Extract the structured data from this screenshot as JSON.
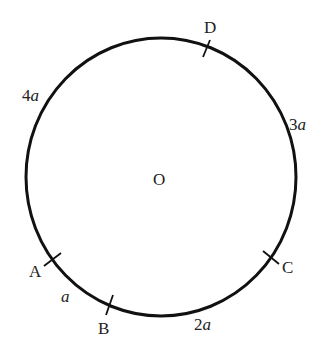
{
  "diagram": {
    "center_label": "O",
    "points": [
      {
        "id": "A",
        "label": "A"
      },
      {
        "id": "B",
        "label": "B"
      },
      {
        "id": "C",
        "label": "C"
      },
      {
        "id": "D",
        "label": "D"
      }
    ],
    "arcs": [
      {
        "from": "A",
        "to": "B",
        "coef": "",
        "var": "a"
      },
      {
        "from": "B",
        "to": "C",
        "coef": "2",
        "var": "a"
      },
      {
        "from": "C",
        "to": "D",
        "coef": "3",
        "var": "a"
      },
      {
        "from": "D",
        "to": "A",
        "coef": "4",
        "var": "a"
      }
    ]
  }
}
